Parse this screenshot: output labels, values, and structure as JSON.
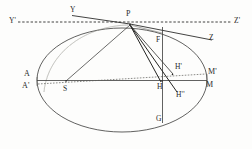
{
  "figure": {
    "type": "line-diagram",
    "background_color": "#fdfdfc",
    "ink_color": "#2a2a2a",
    "width": 252,
    "height": 149
  },
  "labels": {
    "y_prime": "Y'",
    "y": "Y",
    "p": "P",
    "z_prime": "Z'",
    "z": "Z",
    "f": "F",
    "a": "A",
    "a_prime": "A'",
    "s": "S",
    "h": "H",
    "h_prime": "H'",
    "h_double_prime": "H''",
    "m": "M",
    "m_prime": "M'",
    "g": "G"
  },
  "label_positions": {
    "y_prime": {
      "x": 9,
      "y": 19
    },
    "y": {
      "x": 70,
      "y": 8
    },
    "p": {
      "x": 125,
      "y": 12
    },
    "z_prime": {
      "x": 234,
      "y": 19
    },
    "z": {
      "x": 208,
      "y": 36
    },
    "f": {
      "x": 158,
      "y": 38
    },
    "a": {
      "x": 24,
      "y": 72
    },
    "a_prime": {
      "x": 22,
      "y": 84
    },
    "s": {
      "x": 63,
      "y": 88
    },
    "h": {
      "x": 160,
      "y": 85
    },
    "h_prime": {
      "x": 178,
      "y": 66
    },
    "h_double_prime": {
      "x": 180,
      "y": 94
    },
    "m": {
      "x": 205,
      "y": 83
    },
    "m_prime": {
      "x": 208,
      "y": 70
    },
    "g": {
      "x": 158,
      "y": 117
    }
  },
  "geometry": {
    "ellipse": {
      "cx": 122,
      "cy": 80,
      "rx": 85,
      "ry": 52
    },
    "horizontal_dotted_axis": {
      "x1": 18,
      "y1": 22,
      "x2": 232,
      "y2": 22
    },
    "tangent_line": {
      "x1": 72,
      "y1": 16,
      "x2": 212,
      "y2": 40
    },
    "major_axis_AM": {
      "x1": 37,
      "y1": 80,
      "x2": 207,
      "y2": 80
    },
    "dotted_axis_A2M2": {
      "x1": 38,
      "y1": 84,
      "x2": 206,
      "y2": 74
    },
    "vertical_FG": {
      "x1": 162,
      "y1": 28,
      "x2": 162,
      "y2": 122
    },
    "chords_from_P": [
      {
        "to": "S",
        "x2": 66,
        "y2": 82
      },
      {
        "to": "H",
        "x2": 162,
        "y2": 82
      },
      {
        "to": "H''",
        "x2": 176,
        "y2": 92
      },
      {
        "to": "H'",
        "x2": 172,
        "y2": 74
      }
    ],
    "point_P": {
      "x": 130,
      "y": 24
    },
    "point_S": {
      "x": 66,
      "y": 82
    },
    "point_H": {
      "x": 162,
      "y": 81
    },
    "point_Hp": {
      "x": 172,
      "y": 74
    },
    "point_Hpp": {
      "x": 176,
      "y": 92
    }
  },
  "elements": {
    "ellipse_name": "orbit-ellipse",
    "tangent_name": "tangent-line-YZ",
    "dotted_axis_name": "reference-line-Y2Z2",
    "major_axis_name": "major-axis-AM"
  }
}
